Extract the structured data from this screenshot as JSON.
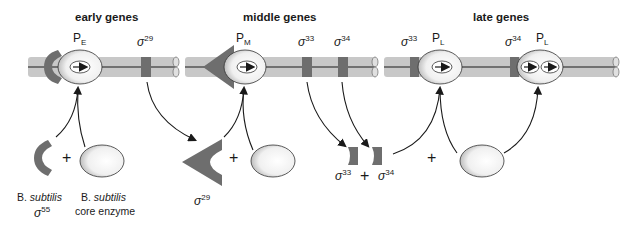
{
  "panels": [
    {
      "header": "early genes",
      "promoter": {
        "letter": "P",
        "sub": "E"
      },
      "sigma_site": {
        "sym": "σ",
        "num": "29"
      }
    },
    {
      "header": "middle genes",
      "promoter": {
        "letter": "P",
        "sub": "M"
      },
      "sigma_sites": [
        {
          "sym": "σ",
          "num": "33"
        },
        {
          "sym": "σ",
          "num": "34"
        }
      ]
    },
    {
      "header": "late genes",
      "promoters": [
        {
          "sigma": {
            "sym": "σ",
            "num": "33"
          },
          "letter": "P",
          "sub": "L"
        },
        {
          "sigma": {
            "sym": "σ",
            "num": "34"
          },
          "letter": "P",
          "sub": "L"
        }
      ]
    }
  ],
  "bottom": {
    "host_sigma": {
      "prefix": "B.",
      "species": "subtilis",
      "sym": "σ",
      "num": "55"
    },
    "core_enzyme": {
      "prefix": "B.",
      "species": "subtilis",
      "line2": "core enzyme"
    },
    "sigma29": {
      "sym": "σ",
      "num": "29"
    },
    "sigma33": {
      "sym": "σ",
      "num": "33"
    },
    "sigma34": {
      "sym": "σ",
      "num": "34"
    },
    "plus": "+"
  },
  "colors": {
    "dna_bar": "#c8c8c8",
    "dna_line": "#1a1a1a",
    "protein": "#6e6e6e",
    "polymerase_fill": "#f2f2f2"
  }
}
